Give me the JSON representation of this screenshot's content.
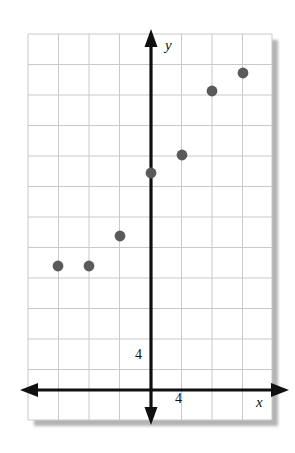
{
  "figure": {
    "kind": "coordinate-plane-scatter-plot",
    "background_color": "#ffffff",
    "paper_color": "#ffffff",
    "grid_color": "#c9c9c9",
    "axis_color": "#101010",
    "point_color": "#5a5a5a",
    "shadow_color": "#b4b4b4"
  },
  "axes": {
    "x_label": "x",
    "y_label": "y",
    "x_tick_label": "4",
    "y_tick_label": "4",
    "x_arrow_left": true,
    "x_arrow_right": true,
    "y_arrow_up": true,
    "y_arrow_down": true
  },
  "chart_data": {
    "type": "scatter",
    "title": "",
    "xlabel": "x",
    "ylabel": "y",
    "grid": true,
    "legend": null,
    "grid_step": 4,
    "xlim": [
      -16,
      16
    ],
    "ylim": [
      -12,
      38
    ],
    "x_ticks": [
      4
    ],
    "y_ticks": [
      4
    ],
    "x_tick_labels": [
      "4"
    ],
    "y_tick_labels": [
      "4"
    ],
    "points": [
      {
        "x": -12,
        "y": 16,
        "px": 58,
        "py": 266
      },
      {
        "x": -8,
        "y": 16,
        "px": 89,
        "py": 266
      },
      {
        "x": -4,
        "y": 20,
        "px": 120,
        "py": 236
      },
      {
        "x": 0,
        "y": 28,
        "px": 151,
        "py": 173
      },
      {
        "x": 4,
        "y": 30,
        "px": 182,
        "py": 155
      },
      {
        "x": 8,
        "y": 39,
        "px": 212,
        "py": 91
      },
      {
        "x": 12,
        "y": 41,
        "px": 243,
        "py": 73
      }
    ],
    "x": [
      -12,
      -8,
      -4,
      0,
      4,
      8,
      12
    ],
    "values": [
      16,
      16,
      20,
      28,
      30,
      39,
      41
    ]
  },
  "geometry": {
    "paper": {
      "left": 28,
      "top": 34,
      "width": 244,
      "height": 386
    },
    "grid_spacing": 30.5,
    "origin": {
      "x": 151,
      "y": 390
    },
    "v_lines": [
      28,
      58.5,
      89,
      119.5,
      151,
      181.5,
      212,
      242.5,
      272
    ],
    "h_lines": [
      34,
      64.5,
      95,
      125.5,
      156,
      186.5,
      217,
      247.5,
      278,
      308.5,
      339,
      369.5,
      390,
      420
    ]
  }
}
